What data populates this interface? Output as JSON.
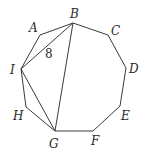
{
  "diagram": {
    "vertices": [
      {
        "name": "A",
        "x": 40,
        "y": 35,
        "label_x": 29,
        "label_y": 32
      },
      {
        "name": "B",
        "x": 73,
        "y": 23,
        "label_x": 70,
        "label_y": 18
      },
      {
        "name": "C",
        "x": 108,
        "y": 35,
        "label_x": 111,
        "label_y": 35
      },
      {
        "name": "D",
        "x": 126,
        "y": 68,
        "label_x": 129,
        "label_y": 73
      },
      {
        "name": "E",
        "x": 120,
        "y": 106,
        "label_x": 121,
        "label_y": 120
      },
      {
        "name": "F",
        "x": 93,
        "y": 131,
        "label_x": 91,
        "label_y": 145
      },
      {
        "name": "G",
        "x": 55,
        "y": 131,
        "label_x": 49,
        "label_y": 148
      },
      {
        "name": "H",
        "x": 26,
        "y": 107,
        "label_x": 13,
        "label_y": 120
      },
      {
        "name": "I",
        "x": 21,
        "y": 69,
        "label_x": 10,
        "label_y": 74
      }
    ],
    "polygon_order": [
      "A",
      "B",
      "C",
      "D",
      "E",
      "F",
      "G",
      "H",
      "I"
    ],
    "diagonals": [
      {
        "from": "I",
        "to": "B"
      },
      {
        "from": "B",
        "to": "G"
      },
      {
        "from": "I",
        "to": "G"
      }
    ],
    "annotations": [
      {
        "text": "8",
        "refers_to": "segment IB",
        "x": 45,
        "y": 58
      }
    ]
  }
}
